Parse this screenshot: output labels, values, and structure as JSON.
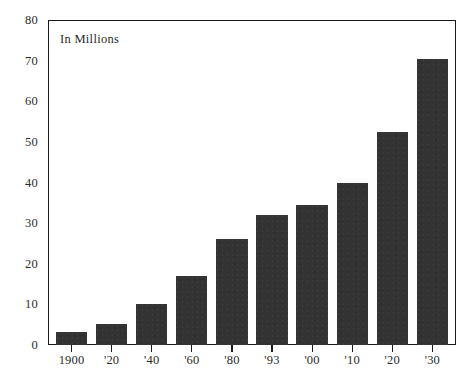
{
  "chart_data": {
    "type": "bar",
    "title": "",
    "subtitle": "",
    "annotation": "In Millions",
    "xlabel": "",
    "ylabel": "",
    "categories": [
      "1900",
      "'20",
      "'40",
      "'60",
      "'80",
      "'93",
      "'00",
      "'10",
      "'20",
      "'30"
    ],
    "values": [
      3,
      5,
      10,
      17,
      26,
      32,
      34.5,
      40,
      52.5,
      70.5
    ],
    "ylim": [
      0,
      80
    ],
    "yticks": [
      0,
      10,
      20,
      30,
      40,
      50,
      60,
      70,
      80
    ],
    "ytick_labels": [
      "0",
      "10",
      "20",
      "30",
      "40",
      "50",
      "60",
      "70",
      "80"
    ],
    "grid": false,
    "legend": null,
    "bar_color": "#333333",
    "axis_color": "#1a1a1a",
    "text_color": "#2b2b2b",
    "background": "#ffffff"
  }
}
